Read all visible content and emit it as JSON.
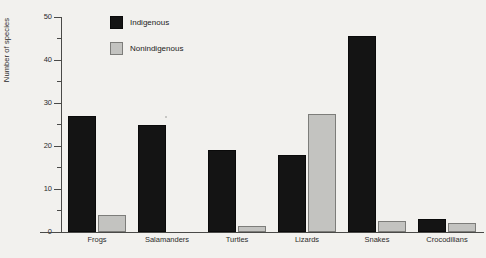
{
  "chart_data": {
    "type": "bar",
    "title": "",
    "xlabel": "",
    "ylabel": "Number of species",
    "ylim": [
      0,
      50
    ],
    "yticks": [
      0,
      10,
      20,
      30,
      40,
      50
    ],
    "yticks_minor": [
      5,
      15,
      25,
      35,
      45
    ],
    "grid": false,
    "legend_position": "top-left-inside",
    "categories": [
      "Frogs",
      "Salamanders",
      "Turtles",
      "Lizards",
      "Snakes",
      "Crocodilians"
    ],
    "series": [
      {
        "name": "Indigenous",
        "color": "#141414",
        "values": [
          27,
          25,
          19,
          18,
          45.5,
          3
        ]
      },
      {
        "name": "Nonindigenous",
        "color": "#c3c3c0",
        "values": [
          4,
          0,
          1.5,
          27.5,
          2.5,
          2
        ]
      }
    ]
  },
  "legend": {
    "items": [
      {
        "label": "Indigenous"
      },
      {
        "label": "Nonindigenous"
      }
    ]
  },
  "axis": {
    "y_title": "Number of species",
    "y_tick_labels": [
      "50",
      "40",
      "30",
      "20",
      "10",
      "0"
    ]
  }
}
